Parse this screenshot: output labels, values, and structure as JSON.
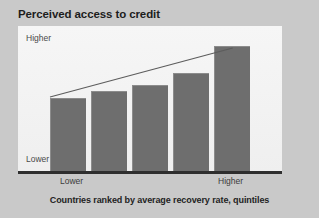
{
  "chart": {
    "title": "Perceived access to credit",
    "caption": "Countries ranked by average recovery rate, quintiles",
    "y_axis": {
      "top_label": "Higher",
      "bottom_label": "Lower"
    },
    "x_axis": {
      "left_label": "Lower",
      "right_label": "Higher"
    },
    "colors": {
      "background": "#c9c9c9",
      "panel": "#f2f2f2",
      "bar": "#6e6e6e",
      "bar_edge": "#8c8c8c",
      "axis": "#2e2e2e",
      "trend_line": "#5c5c5c",
      "title_text": "#1d1d1d",
      "label_text": "#4a4a4a"
    }
  },
  "chart_data": {
    "type": "bar",
    "title": "Perceived access to credit",
    "xlabel": "Countries ranked by average recovery rate, quintiles",
    "ylabel": "Perceived access to credit",
    "categories": [
      "1",
      "2",
      "3",
      "4",
      "5"
    ],
    "category_labels": [
      "Lower",
      "",
      "",
      "",
      "Higher"
    ],
    "values": [
      51,
      56,
      60,
      68,
      87
    ],
    "ylim": [
      0,
      100
    ],
    "ytick_labels": [
      "Lower",
      "Higher"
    ],
    "grid": false,
    "legend": false,
    "annotations": [
      {
        "type": "trend-line",
        "label": "upward trend line",
        "x_start": 0,
        "y_start": 49,
        "x_end": 4,
        "y_end": 84
      }
    ]
  }
}
